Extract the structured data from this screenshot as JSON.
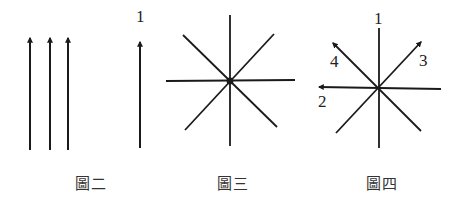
{
  "figures": [
    {
      "caption": "圖二",
      "description": "three parallel upward arrows, plus a single upward arrow labeled 1",
      "single_arrow_label": "1"
    },
    {
      "caption": "圖三",
      "description": "eight-ray star of lines through a common center point"
    },
    {
      "caption": "圖四",
      "description": "eight-ray star with four arrowed directions labeled",
      "labels": [
        "1",
        "2",
        "3",
        "4"
      ]
    }
  ],
  "colors": {
    "line": "#1a1a1a",
    "background": "#ffffff"
  }
}
